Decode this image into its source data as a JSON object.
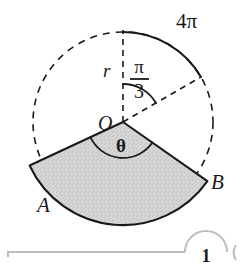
{
  "figure": {
    "type": "geometry-diagram",
    "circle": {
      "center_x": 123,
      "center_y": 122,
      "radius": 90,
      "center_label": "O",
      "radius_label": "r"
    },
    "arc_label": "4π",
    "angle_top_numerator": "π",
    "angle_top_denominator": "3",
    "angle_sector_label": "θ",
    "point_a_label": "A",
    "point_b_label": "B",
    "sector": {
      "start_angle_deg": 205,
      "end_angle_deg": 325,
      "outer_radius": 103
    },
    "colors": {
      "stroke": "#1a1a1a",
      "shade_fill": "#d2d2d2",
      "shade_stroke": "#1a1a1a",
      "page_background": "#ffffff",
      "footer_rule": "#b9b9b9"
    }
  },
  "footer": {
    "page_marker": "1"
  }
}
